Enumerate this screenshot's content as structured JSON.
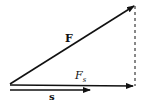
{
  "diagram": {
    "labels": {
      "force": "F",
      "component": "F",
      "component_sub": "s",
      "displacement": "s"
    },
    "colors": {
      "stroke": "#111111",
      "background": "#ffffff"
    }
  }
}
